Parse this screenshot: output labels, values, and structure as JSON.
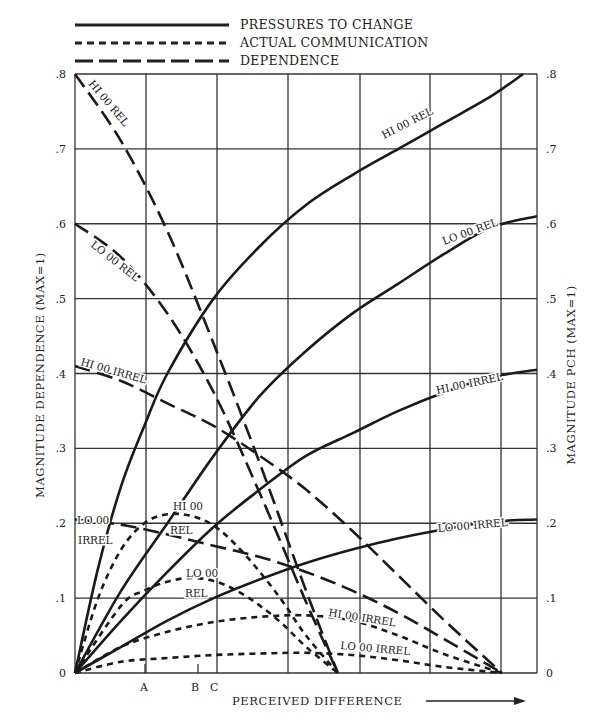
{
  "legend": [
    {
      "label": "PRESSURES TO CHANGE",
      "style": "solid"
    },
    {
      "label": "ACTUAL COMMUNICATION",
      "style": "dotted"
    },
    {
      "label": "DEPENDENCE",
      "style": "dashed"
    }
  ],
  "axes": {
    "left_label": "MAGNITUDE DEPENDENCE  (MAX=1)",
    "right_label": "MAGNITUDE PCH  (MAX=1)",
    "x_label": "PERCEIVED DIFFERENCE",
    "y_ticks": [
      ".8",
      ".7",
      ".6",
      ".5",
      ".4",
      ".3",
      ".2",
      ".1",
      "0"
    ],
    "x_markers": [
      "A",
      "B",
      "C"
    ]
  },
  "chart_data": {
    "type": "line",
    "title": "",
    "xlabel": "PERCEIVED DIFFERENCE",
    "ylabel": "MAGNITUDE DEPENDENCE (MAX=1)",
    "ylabel_right": "MAGNITUDE PCH (MAX=1)",
    "ylim": [
      0,
      0.8
    ],
    "xlim": [
      0,
      1
    ],
    "grid": true,
    "legend_position": "top",
    "x_markers": {
      "A": 0.152,
      "B": 0.267,
      "C": 0.305
    },
    "series": [
      {
        "name": "HI 00 REL",
        "kind": "pressures to change",
        "style": "solid",
        "x": [
          0,
          0.05,
          0.1,
          0.15,
          0.2,
          0.3,
          0.4,
          0.5,
          0.6,
          0.7,
          0.8,
          0.9,
          0.97
        ],
        "y": [
          0,
          0.14,
          0.25,
          0.33,
          0.4,
          0.5,
          0.57,
          0.625,
          0.665,
          0.7,
          0.735,
          0.77,
          0.8
        ]
      },
      {
        "name": "LO 00 REL",
        "kind": "pressures to change",
        "style": "solid",
        "x": [
          0,
          0.1,
          0.2,
          0.3,
          0.4,
          0.5,
          0.6,
          0.7,
          0.8,
          0.9,
          1.0
        ],
        "y": [
          0,
          0.11,
          0.2,
          0.29,
          0.37,
          0.43,
          0.48,
          0.52,
          0.56,
          0.595,
          0.61
        ]
      },
      {
        "name": "HI 00 IRREL",
        "kind": "pressures to change",
        "style": "solid",
        "x": [
          0,
          0.1,
          0.2,
          0.3,
          0.4,
          0.5,
          0.6,
          0.7,
          0.8,
          0.9,
          1.0
        ],
        "y": [
          0,
          0.07,
          0.135,
          0.195,
          0.245,
          0.29,
          0.32,
          0.35,
          0.375,
          0.395,
          0.405
        ]
      },
      {
        "name": "LO 00 IRREL",
        "kind": "pressures to change",
        "style": "solid",
        "x": [
          0,
          0.1,
          0.2,
          0.3,
          0.4,
          0.5,
          0.6,
          0.7,
          0.8,
          0.9,
          1.0
        ],
        "y": [
          0,
          0.035,
          0.07,
          0.1,
          0.125,
          0.147,
          0.165,
          0.18,
          0.192,
          0.202,
          0.205
        ]
      },
      {
        "name": "HI 00 REL",
        "kind": "actual communication",
        "style": "dotted",
        "x": [
          0,
          0.05,
          0.1,
          0.15,
          0.2,
          0.25,
          0.3,
          0.35,
          0.4,
          0.45,
          0.5,
          0.569
        ],
        "y": [
          0,
          0.1,
          0.165,
          0.2,
          0.212,
          0.21,
          0.197,
          0.17,
          0.135,
          0.095,
          0.05,
          0
        ]
      },
      {
        "name": "LO 00 REL",
        "kind": "actual communication",
        "style": "dotted",
        "x": [
          0,
          0.1,
          0.15,
          0.2,
          0.25,
          0.3,
          0.35,
          0.4,
          0.45,
          0.5,
          0.569
        ],
        "y": [
          0,
          0.09,
          0.11,
          0.122,
          0.127,
          0.123,
          0.11,
          0.09,
          0.065,
          0.035,
          0
        ]
      },
      {
        "name": "HI 00 IRREL",
        "kind": "actual communication",
        "style": "dotted",
        "x": [
          0,
          0.1,
          0.2,
          0.3,
          0.4,
          0.5,
          0.6,
          0.7,
          0.8,
          0.924
        ],
        "y": [
          0,
          0.035,
          0.055,
          0.068,
          0.075,
          0.077,
          0.07,
          0.05,
          0.025,
          0
        ]
      },
      {
        "name": "LO 00 IRREL",
        "kind": "actual communication",
        "style": "dotted",
        "x": [
          0,
          0.1,
          0.2,
          0.3,
          0.4,
          0.5,
          0.6,
          0.7,
          0.8,
          0.924
        ],
        "y": [
          0,
          0.015,
          0.02,
          0.024,
          0.026,
          0.027,
          0.024,
          0.017,
          0.008,
          0
        ]
      },
      {
        "name": "HI 00 REL",
        "kind": "dependence",
        "style": "dashed",
        "x": [
          0,
          0.1,
          0.2,
          0.3,
          0.4,
          0.5,
          0.569
        ],
        "y": [
          0.8,
          0.71,
          0.59,
          0.44,
          0.28,
          0.11,
          0
        ]
      },
      {
        "name": "LO 00 REL",
        "kind": "dependence",
        "style": "dashed",
        "x": [
          0,
          0.1,
          0.2,
          0.3,
          0.4,
          0.5,
          0.569
        ],
        "y": [
          0.6,
          0.555,
          0.48,
          0.375,
          0.24,
          0.095,
          0
        ]
      },
      {
        "name": "HI 00 IRREL",
        "kind": "dependence",
        "style": "dashed",
        "x": [
          0,
          0.1,
          0.2,
          0.3,
          0.4,
          0.5,
          0.6,
          0.7,
          0.8,
          0.924
        ],
        "y": [
          0.41,
          0.39,
          0.36,
          0.33,
          0.29,
          0.245,
          0.19,
          0.13,
          0.07,
          0
        ]
      },
      {
        "name": "LO 00 IRREL",
        "kind": "dependence",
        "style": "dashed",
        "x": [
          0,
          0.1,
          0.2,
          0.3,
          0.4,
          0.5,
          0.6,
          0.7,
          0.8,
          0.924
        ],
        "y": [
          0.205,
          0.198,
          0.185,
          0.17,
          0.155,
          0.135,
          0.11,
          0.08,
          0.045,
          0
        ]
      }
    ]
  },
  "curve_labels": [
    {
      "text": "HI 00 REL",
      "x": 88,
      "y": 84,
      "rot": 50
    },
    {
      "text": "LO 00 REL",
      "x": 90,
      "y": 246,
      "rot": 38
    },
    {
      "text": "HI 00 IRREL",
      "x": 80,
      "y": 365,
      "rot": 16
    },
    {
      "text": "LO 00",
      "x": 77,
      "y": 524,
      "rot": 0
    },
    {
      "text": "IRREL",
      "x": 78,
      "y": 544,
      "rot": 0
    },
    {
      "text": "HI 00",
      "x": 173,
      "y": 510,
      "rot": 0
    },
    {
      "text": "REL",
      "x": 170,
      "y": 534,
      "rot": 0
    },
    {
      "text": "LO 00",
      "x": 186,
      "y": 577,
      "rot": 0
    },
    {
      "text": "REL",
      "x": 185,
      "y": 597,
      "rot": 0
    },
    {
      "text": "HI 00 REL",
      "x": 384,
      "y": 139,
      "rot": -27
    },
    {
      "text": "LO 00 REL",
      "x": 444,
      "y": 245,
      "rot": -20
    },
    {
      "text": "HI 00 IRREL",
      "x": 437,
      "y": 394,
      "rot": -12
    },
    {
      "text": "LO 00 IRREL",
      "x": 438,
      "y": 532,
      "rot": -5
    },
    {
      "text": "HI 00 IRREL",
      "x": 328,
      "y": 616,
      "rot": 9
    },
    {
      "text": "LO 00 IRREL",
      "x": 340,
      "y": 649,
      "rot": 5
    }
  ]
}
